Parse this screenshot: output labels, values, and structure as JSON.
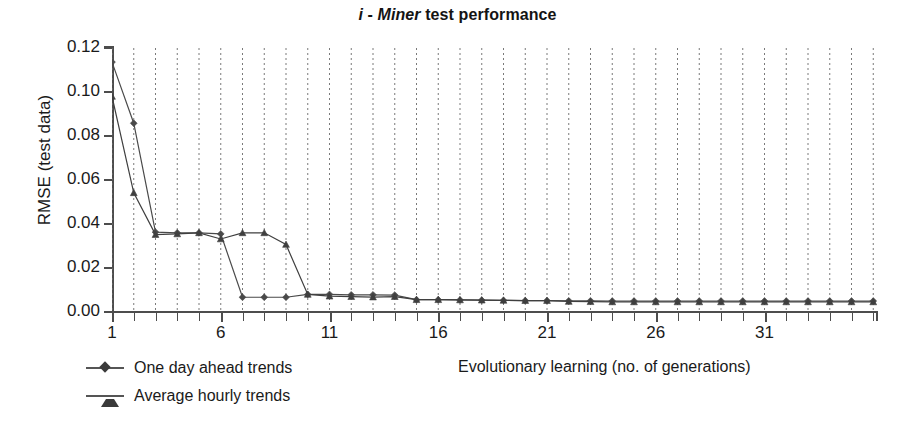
{
  "title": {
    "i": "i",
    "dash": " - ",
    "miner": "Miner",
    "rest": " test performance",
    "full": "i - Miner test performance"
  },
  "axis_title_x": "Evolutionary learning (no. of generations)",
  "axis_title_y": "RMSE (test data)",
  "legend": {
    "items": [
      {
        "label": "One day ahead trends",
        "marker": "diamond",
        "color": "#3a3a3a"
      },
      {
        "label": "Average hourly trends",
        "marker": "triangle",
        "color": "#3a3a3a"
      }
    ]
  },
  "colors": {
    "series_one_day": "#4a4a4a",
    "series_avg_hourly": "#3f3f3f",
    "axis": "#4d4d4d",
    "grid": "#7a7a7a",
    "text": "#1a1a1a",
    "background": "#ffffff"
  },
  "chart_data": {
    "type": "line",
    "title": "i - Miner test performance",
    "xlabel": "Evolutionary learning (no. of generations)",
    "ylabel": "RMSE (test data)",
    "xlim": [
      1,
      36
    ],
    "ylim": [
      0.0,
      0.12
    ],
    "ytick_labels": [
      "0.12",
      "0.10",
      "0.08",
      "0.06",
      "0.04",
      "0.02",
      "0.00"
    ],
    "ytick_values": [
      0.12,
      0.1,
      0.08,
      0.06,
      0.04,
      0.02,
      0.0
    ],
    "xtick_labels": [
      "1",
      "6",
      "11",
      "16",
      "21",
      "26",
      "31"
    ],
    "xtick_values": [
      1,
      6,
      11,
      16,
      21,
      26,
      31
    ],
    "grid": "vertical dotted gridlines at every generation",
    "legend_position": "below-left",
    "series": [
      {
        "name": "One day ahead trends",
        "marker": "diamond",
        "x": [
          1,
          2,
          3,
          4,
          5,
          6,
          7,
          8,
          9,
          10,
          11,
          12,
          13,
          14,
          15,
          16,
          17,
          18,
          19,
          20,
          21,
          22,
          23,
          24,
          25,
          26,
          27,
          28,
          29,
          30,
          31,
          32,
          33,
          34,
          35,
          36
        ],
        "values": [
          0.1136,
          0.0858,
          0.0363,
          0.036,
          0.036,
          0.0355,
          0.0067,
          0.0067,
          0.0067,
          0.008,
          0.008,
          0.0078,
          0.0078,
          0.0077,
          0.0056,
          0.0056,
          0.0055,
          0.0054,
          0.0053,
          0.0052,
          0.0052,
          0.0051,
          0.0051,
          0.005,
          0.005,
          0.005,
          0.005,
          0.005,
          0.005,
          0.005,
          0.005,
          0.005,
          0.005,
          0.005,
          0.005,
          0.005
        ]
      },
      {
        "name": "Average hourly trends",
        "marker": "triangle",
        "x": [
          1,
          2,
          3,
          4,
          5,
          6,
          7,
          8,
          9,
          10,
          11,
          12,
          13,
          14,
          15,
          16,
          17,
          18,
          19,
          20,
          21,
          22,
          23,
          24,
          25,
          26,
          27,
          28,
          29,
          30,
          31,
          32,
          33,
          34,
          35,
          36
        ],
        "values": [
          0.098,
          0.0542,
          0.0352,
          0.0355,
          0.036,
          0.0332,
          0.036,
          0.036,
          0.0307,
          0.008,
          0.0072,
          0.007,
          0.0068,
          0.007,
          0.0056,
          0.0056,
          0.0055,
          0.0054,
          0.0053,
          0.0052,
          0.0052,
          0.0048,
          0.0047,
          0.0046,
          0.0046,
          0.0046,
          0.0046,
          0.0046,
          0.0046,
          0.0046,
          0.0046,
          0.0046,
          0.0046,
          0.0046,
          0.0046,
          0.0046
        ]
      }
    ]
  }
}
